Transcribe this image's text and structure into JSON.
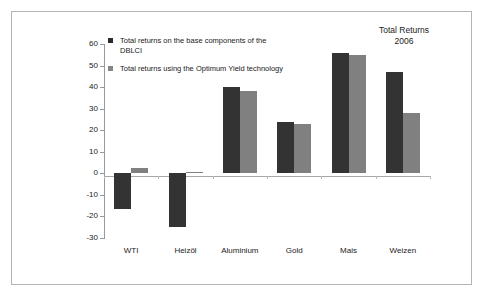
{
  "chart_data": {
    "type": "bar",
    "title": "Total Returns 2006",
    "title_line1": "Total Returns",
    "title_line2": "2006",
    "xlabel": "",
    "ylabel": "",
    "ylim": [
      -30,
      60
    ],
    "yticks": [
      60,
      50,
      40,
      30,
      20,
      10,
      0,
      -10,
      -20,
      -30
    ],
    "ytick_labels": [
      "60",
      "50",
      "40",
      "30",
      "20",
      "10",
      "0",
      "-10",
      "-20",
      "-30"
    ],
    "grid": false,
    "legend_position": "upper-left-inside",
    "categories": [
      "WTI",
      "Heizöl",
      "Aluminium",
      "Gold",
      "Mais",
      "Weizen"
    ],
    "series": [
      {
        "name": "Total returns on the base components of the DBLCI",
        "color": "#333333",
        "values": [
          -16.5,
          -25.0,
          40.0,
          24.0,
          56.0,
          47.0
        ]
      },
      {
        "name": "Total returns using the Optimum Yield technology",
        "color": "#808080",
        "values": [
          2.5,
          0.8,
          38.0,
          23.0,
          55.0,
          28.0
        ]
      }
    ]
  },
  "legend": {
    "items": [
      {
        "swatch": "dark",
        "label": "Total returns on the base components of the DBLCI"
      },
      {
        "swatch": "gray",
        "label": "Total returns using the Optimum Yield technology"
      }
    ]
  },
  "colors": {
    "series_base": "#333333",
    "series_optimum_yield": "#808080",
    "axis": "#9a9a9a",
    "frame": "#b4b4b4",
    "background": "#ffffff",
    "text": "#1a1a1a"
  }
}
